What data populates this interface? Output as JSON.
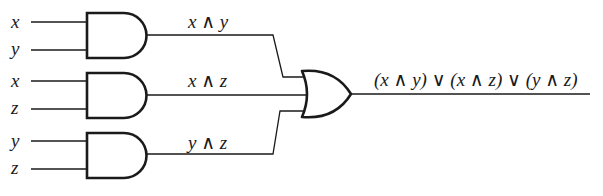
{
  "diagram": {
    "type": "logic-circuit",
    "inputs": [
      {
        "gate": 1,
        "labels": [
          "x",
          "y"
        ]
      },
      {
        "gate": 2,
        "labels": [
          "x",
          "z"
        ]
      },
      {
        "gate": 3,
        "labels": [
          "y",
          "z"
        ]
      }
    ],
    "and_gates": [
      {
        "id": 1,
        "output_label": "x ∧ y"
      },
      {
        "id": 2,
        "output_label": "x ∧ z"
      },
      {
        "id": 3,
        "output_label": "y ∧ z"
      }
    ],
    "or_gate": {
      "output_label": "(x ∧ y) ∨ (x ∧ z) ∨ (y ∧ z)"
    },
    "colors": {
      "line": "#1a1a1a",
      "background": "#ffffff"
    }
  }
}
